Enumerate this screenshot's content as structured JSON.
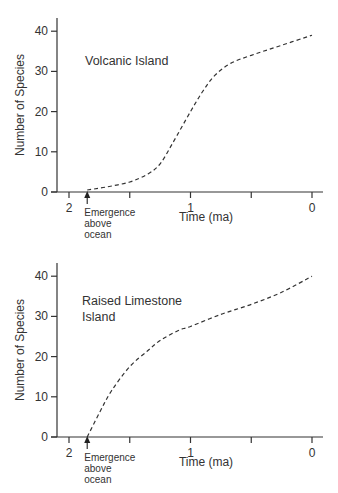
{
  "chart_data": [
    {
      "type": "line",
      "title": "Volcanic Island",
      "xlabel": "Time (ma)",
      "ylabel": "Number of Species",
      "x_ticks": [
        2,
        1.5,
        1,
        0.5,
        0
      ],
      "x_tick_labels": [
        "2",
        "",
        "1",
        "",
        "0"
      ],
      "y_ticks": [
        0,
        10,
        20,
        30,
        40
      ],
      "y_tick_labels": [
        "0",
        "10",
        "20",
        "30",
        "40"
      ],
      "xlim": [
        2.1,
        -0.1
      ],
      "ylim": [
        0,
        44
      ],
      "grid": false,
      "line_style": "dashed",
      "annotation": {
        "text": [
          "Emergence",
          "above",
          "ocean"
        ],
        "x": 1.85,
        "marker": "up-arrow"
      },
      "series": [
        {
          "name": "Volcanic Island",
          "x": [
            1.85,
            1.7,
            1.5,
            1.35,
            1.25,
            1.15,
            1.0,
            0.9,
            0.8,
            0.67,
            0.5,
            0.3,
            0.0
          ],
          "values": [
            0.5,
            1.2,
            2.5,
            4.5,
            7,
            12,
            20,
            25,
            29,
            32,
            34,
            36,
            39
          ]
        }
      ]
    },
    {
      "type": "line",
      "title": "Raised Limestone Island",
      "xlabel": "Time (ma)",
      "ylabel": "Number of Species",
      "x_ticks": [
        2,
        1.5,
        1,
        0.5,
        0
      ],
      "x_tick_labels": [
        "2",
        "",
        "1",
        "",
        "0"
      ],
      "y_ticks": [
        0,
        10,
        20,
        30,
        40
      ],
      "y_tick_labels": [
        "0",
        "10",
        "20",
        "30",
        "40"
      ],
      "xlim": [
        2.1,
        -0.1
      ],
      "ylim": [
        0,
        44
      ],
      "grid": false,
      "line_style": "dashed",
      "annotation": {
        "text": [
          "Emergence",
          "above",
          "ocean"
        ],
        "x": 1.85,
        "marker": "up-arrow"
      },
      "series": [
        {
          "name": "Raised Limestone Island",
          "x": [
            1.85,
            1.75,
            1.65,
            1.5,
            1.35,
            1.25,
            1.1,
            1.0,
            0.75,
            0.5,
            0.25,
            0.0
          ],
          "values": [
            0,
            6,
            11.5,
            17.5,
            21.5,
            24,
            26.5,
            27.5,
            30.5,
            33,
            36,
            40
          ]
        }
      ]
    }
  ],
  "panels": [
    {
      "title_lines": [
        "Volcanic Island"
      ]
    },
    {
      "title_lines": [
        "Raised Limestone",
        "Island"
      ]
    }
  ]
}
